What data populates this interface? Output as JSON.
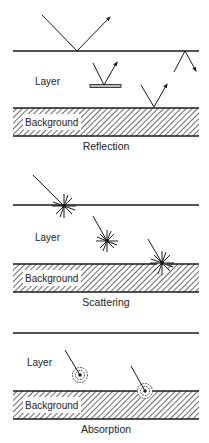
{
  "panels": [
    {
      "id": "reflection",
      "caption": "Reflection",
      "layer_label": "Layer",
      "background_label": "Background"
    },
    {
      "id": "scattering",
      "caption": "Scattering",
      "layer_label": "Layer",
      "background_label": "Background"
    },
    {
      "id": "absorption",
      "caption": "Absorption",
      "layer_label": "Layer",
      "background_label": "Background"
    }
  ]
}
